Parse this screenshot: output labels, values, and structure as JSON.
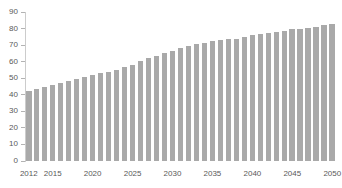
{
  "chart_data": {
    "type": "bar",
    "title": "",
    "xlabel": "",
    "ylabel": "",
    "x": [
      2012,
      2013,
      2014,
      2015,
      2016,
      2017,
      2018,
      2019,
      2020,
      2021,
      2022,
      2023,
      2024,
      2025,
      2026,
      2027,
      2028,
      2029,
      2030,
      2031,
      2032,
      2033,
      2034,
      2035,
      2036,
      2037,
      2038,
      2039,
      2040,
      2041,
      2042,
      2043,
      2044,
      2045,
      2046,
      2047,
      2048,
      2049,
      2050
    ],
    "values": [
      42.5,
      43.5,
      44.5,
      46,
      47,
      48.5,
      49.5,
      50.5,
      52,
      53,
      54,
      55,
      57,
      58,
      60.5,
      62,
      63.5,
      65,
      66.5,
      68,
      69.5,
      70.5,
      71.5,
      72.5,
      73,
      73.5,
      74,
      75,
      76,
      76.5,
      77.5,
      78,
      78.5,
      79.5,
      80,
      80.5,
      81,
      82,
      83
    ],
    "ylim": [
      0,
      90
    ],
    "yticks": [
      0,
      10,
      20,
      30,
      40,
      50,
      60,
      70,
      80,
      90
    ],
    "xtick_labels": [
      "2012",
      "2015",
      "2020",
      "2025",
      "2030",
      "2035",
      "2040",
      "2045",
      "2050"
    ],
    "xtick_indices": [
      0,
      3,
      8,
      13,
      18,
      23,
      28,
      33,
      38
    ],
    "grid": false,
    "legend": false,
    "bar_color": "#a9a9a9",
    "axis_line_color": "#cccccc",
    "tick_color": "#b3b3b3",
    "label_color": "#595959",
    "background_color": "#ffffff"
  }
}
